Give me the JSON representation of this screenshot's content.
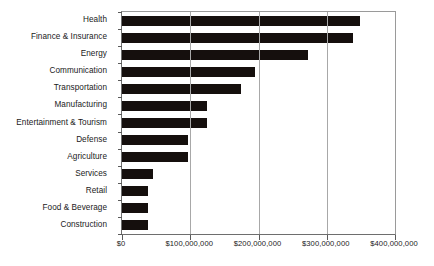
{
  "chart_data": {
    "type": "bar",
    "orientation": "horizontal",
    "title": "",
    "subtitle": "",
    "xlabel": "",
    "ylabel": "",
    "xlim": [
      0,
      400000000
    ],
    "ylim": null,
    "grid": true,
    "legend": null,
    "legend_position": "none",
    "bar_color": "#150f0d",
    "axis_color": "#6e6e6e",
    "grid_color": "#a8a8a8",
    "background_color": "#ffffff",
    "x_tick_labels": [
      "$0",
      "$100,000,000",
      "$200,000,000",
      "$300,000,000",
      "$400,000,000"
    ],
    "x_tick_values": [
      0,
      100000000,
      200000000,
      300000000,
      400000000
    ],
    "categories": [
      "Health",
      "Finance & Insurance",
      "Energy",
      "Communication",
      "Transportation",
      "Manufacturing",
      "Entertainment & Tourism",
      "Defense",
      "Agriculture",
      "Services",
      "Retail",
      "Food & Beverage",
      "Construction"
    ],
    "values": [
      348000000,
      339000000,
      273000000,
      195000000,
      174000000,
      125000000,
      125000000,
      96000000,
      96000000,
      45000000,
      38000000,
      38000000,
      38000000
    ]
  }
}
